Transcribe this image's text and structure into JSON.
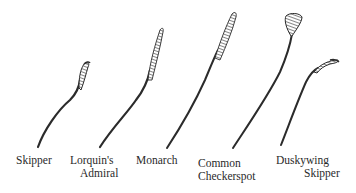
{
  "figure": {
    "type": "illustration",
    "stroke_color": "#2b2b2b",
    "background": "#ffffff"
  },
  "antennae": [
    {
      "name": "Skipper",
      "label_lines": [
        "Skipper"
      ],
      "tip": "hooked club"
    },
    {
      "name": "Lorquin's Admiral",
      "label_lines": [
        "Lorquin's",
        "Admiral"
      ],
      "tip": "slender club"
    },
    {
      "name": "Monarch",
      "label_lines": [
        "Monarch"
      ],
      "tip": "long gradual club"
    },
    {
      "name": "Common Checkerspot",
      "label_lines": [
        "Common",
        "Checkerspot"
      ],
      "tip": "rounded spoon club"
    },
    {
      "name": "Duskywing Skipper",
      "label_lines": [
        "Duskywing",
        "Skipper"
      ],
      "tip": "hooked apiculus"
    }
  ]
}
